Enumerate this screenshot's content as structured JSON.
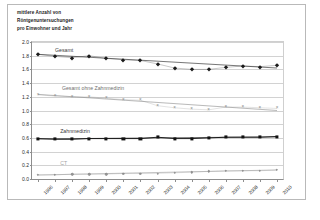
{
  "title": {
    "line1": "mittlere Anzahl von",
    "line2": "Röntgenuntersuchungen",
    "line3": "pro Einwohner und Jahr"
  },
  "chart_data": {
    "type": "line",
    "title": "mittlere Anzahl von Röntgenuntersuchungen pro Einwohner und Jahr",
    "xlabel": "",
    "ylabel": "mittlere Anzahl von Röntgenuntersuchungen pro Einwohner und Jahr",
    "ylim": [
      0.0,
      2.0
    ],
    "ytick_step": 0.2,
    "grid": true,
    "legend": "inline-labels",
    "categories": [
      "1996",
      "1997",
      "1998",
      "1999",
      "2000",
      "2001",
      "2002",
      "2003",
      "2004",
      "2005",
      "2006",
      "2007",
      "2008",
      "2009",
      "2010"
    ],
    "yticks": [
      "0.0",
      "0.2",
      "0.4",
      "0.6",
      "0.8",
      "1.0",
      "1.2",
      "1.4",
      "1.6",
      "1.8",
      "2.0"
    ],
    "series": [
      {
        "name": "Gesamt",
        "marker": "diamond",
        "color": "#1b1b1b",
        "label_x_index": 1,
        "label_y": 1.89,
        "values": [
          1.82,
          1.79,
          1.77,
          1.8,
          1.76,
          1.74,
          1.73,
          1.68,
          1.62,
          1.6,
          1.6,
          1.63,
          1.65,
          1.64,
          1.66
        ],
        "trend_start": 1.82,
        "trend_end": 1.62
      },
      {
        "name": "Gesamt ohne Zahnmedizin",
        "marker": "cross",
        "color": "#8b8b8b",
        "label_x_index": 1.4,
        "label_y": 1.33,
        "values": [
          1.23,
          1.21,
          1.2,
          1.2,
          1.18,
          1.16,
          1.15,
          1.07,
          1.04,
          1.02,
          1.01,
          1.05,
          1.05,
          1.04,
          1.03
        ],
        "trend_start": 1.235,
        "trend_end": 1.0
      },
      {
        "name": "Zahnmedizin",
        "marker": "square",
        "color": "#111111",
        "label_x_index": 1.3,
        "label_y": 0.7,
        "values": [
          0.59,
          0.58,
          0.58,
          0.59,
          0.59,
          0.59,
          0.59,
          0.61,
          0.59,
          0.59,
          0.6,
          0.61,
          0.61,
          0.61,
          0.62
        ],
        "trend_start": 0.585,
        "trend_end": 0.615
      },
      {
        "name": "CT",
        "marker": "dot",
        "color": "#9a9a9a",
        "label_x_index": 1.3,
        "label_y": 0.23,
        "values": [
          0.06,
          0.06,
          0.07,
          0.07,
          0.07,
          0.08,
          0.08,
          0.08,
          0.09,
          0.1,
          0.11,
          0.12,
          0.12,
          0.12,
          0.13
        ],
        "trend_start": 0.058,
        "trend_end": 0.132
      }
    ]
  }
}
